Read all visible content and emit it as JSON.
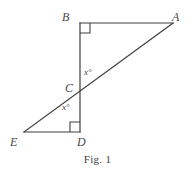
{
  "figure": {
    "caption": "Fig. 1",
    "background_color": "#ffffff",
    "stroke_color": "#3f3f3f",
    "label_color": "#4a4a4a",
    "vertices": [
      {
        "id": "A",
        "label": "A",
        "x": 173,
        "y": 23
      },
      {
        "id": "B",
        "label": "B",
        "x": 80,
        "y": 23
      },
      {
        "id": "C",
        "label": "C",
        "x": 80,
        "y": 88
      },
      {
        "id": "D",
        "label": "D",
        "x": 80,
        "y": 132
      },
      {
        "id": "E",
        "label": "E",
        "x": 24,
        "y": 132
      }
    ],
    "segments": [
      {
        "id": "BA",
        "from": "B",
        "to": "A",
        "x1": 80,
        "y1": 23,
        "x2": 173,
        "y2": 23
      },
      {
        "id": "BD",
        "from": "B",
        "to": "D",
        "x1": 80,
        "y1": 23,
        "x2": 80,
        "y2": 132
      },
      {
        "id": "ED",
        "from": "E",
        "to": "D",
        "x1": 24,
        "y1": 132,
        "x2": 80,
        "y2": 132
      },
      {
        "id": "EA",
        "from": "E",
        "to": "A",
        "x1": 24,
        "y1": 132,
        "x2": 173,
        "y2": 23
      }
    ],
    "right_angles": [
      {
        "id": "right-angle-B",
        "vertex": "B",
        "path": "M 80 33 L 90 33 L 90 23"
      },
      {
        "id": "right-angle-D",
        "vertex": "D",
        "path": "M 70 132 L 70 122 L 80 122"
      }
    ],
    "angle_labels": [
      {
        "id": "angle-upper",
        "text": "x°",
        "at_vertex": "C",
        "position": "above-right"
      },
      {
        "id": "angle-lower",
        "text": "x°",
        "at_vertex": "C",
        "position": "below-left"
      }
    ]
  }
}
